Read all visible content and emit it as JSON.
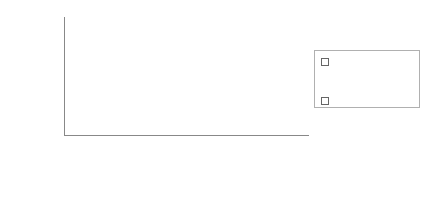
{
  "chart_data": {
    "type": "bar",
    "stacked": true,
    "title": "",
    "xlabel": "",
    "ylabel": "Percent",
    "ylim": [
      0,
      100
    ],
    "yticks": [
      0,
      10,
      20,
      30,
      40,
      50,
      60,
      70,
      80,
      90,
      100
    ],
    "grid": false,
    "legend_position": "right",
    "categories": [
      "No education",
      "Elementary",
      "Technical secondary",
      "General secondary and university"
    ],
    "category_lines": [
      [
        "No",
        "education"
      ],
      [
        "Elementary"
      ],
      [
        "Technical",
        "secondary"
      ],
      [
        "General",
        "secondary",
        "and",
        "university"
      ]
    ],
    "series": [
      {
        "name": "Roma",
        "color": "#1a1a1a",
        "values": [
          82,
          40,
          7,
          1
        ]
      },
      {
        "name": "Other registered unemployed",
        "color": "#a6a6a6",
        "values": [
          18,
          60,
          93,
          99
        ]
      }
    ]
  },
  "legend": {
    "items": [
      {
        "label_lines": [
          "Other",
          "registered",
          "unemployed"
        ],
        "color": "#a6a6a6"
      },
      {
        "label_lines": [
          "Roma"
        ],
        "color": "#1a1a1a"
      }
    ]
  }
}
